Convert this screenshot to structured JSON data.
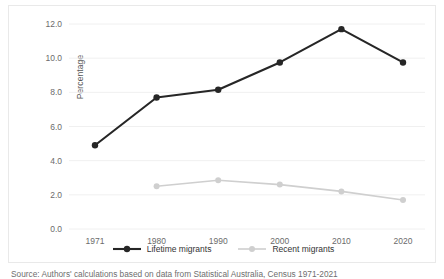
{
  "chart_data": {
    "type": "line",
    "title": "",
    "xlabel": "",
    "ylabel": "Percentage",
    "categories": [
      "1971",
      "1980",
      "1990",
      "2000",
      "2010",
      "2020"
    ],
    "ylim": [
      0.0,
      12.0
    ],
    "yticks": [
      "0.0",
      "2.0",
      "4.0",
      "6.0",
      "8.0",
      "10.0",
      "12.0"
    ],
    "ytick_values": [
      0.0,
      2.0,
      4.0,
      6.0,
      8.0,
      10.0,
      12.0
    ],
    "grid": "horizontal",
    "legend_position": "bottom-center",
    "series": [
      {
        "name": "Lifetime migrants",
        "color": "#262626",
        "marker": "filled-circle",
        "values": [
          4.9,
          7.7,
          8.15,
          9.75,
          11.7,
          9.75
        ]
      },
      {
        "name": "Recent migrants",
        "color": "#cfcfcf",
        "marker": "filled-circle",
        "values": [
          null,
          2.5,
          2.85,
          2.6,
          2.2,
          1.7
        ]
      }
    ]
  },
  "axes": {
    "y_title": "Percentage"
  },
  "legend": {
    "items": [
      {
        "label": "Lifetime migrants",
        "color": "#262626"
      },
      {
        "label": "Recent migrants",
        "color": "#cfcfcf"
      }
    ]
  },
  "caption": {
    "source": "Source: Authors' calculations based on data from Statistical Australia, Census 1971-2021"
  }
}
